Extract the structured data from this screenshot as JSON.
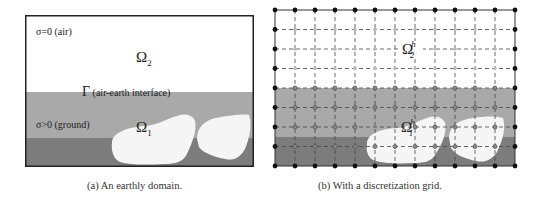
{
  "figure_a": {
    "caption": "(a) An earthly domain.",
    "labels": {
      "air": "σ=0  (air)",
      "omega2": "Ω",
      "omega2_sub": "2",
      "interface_symbol": "Γ",
      "interface": " (air-earth interface)",
      "ground": "σ>0  (ground)",
      "omega1": "Ω",
      "omega1_sub": "1"
    },
    "colors": {
      "air": "#ffffff",
      "ground_upper": "#a9a9a9",
      "ground_lower": "#7c7c7c",
      "inclusion": "#f5f5f5",
      "border": "#222222"
    }
  },
  "figure_b": {
    "caption": "(b) With a discretization grid.",
    "labels": {
      "omega2": "Ω",
      "omega2_sup": "h",
      "omega2_sub": "2",
      "omega1": "Ω",
      "omega1_sup": "h",
      "omega1_sub": "1"
    },
    "grid": {
      "columns": 12,
      "rows": 8,
      "boundary_node": "filled-black",
      "air_node": "light-gray",
      "ground_node": "gray-open-circle"
    }
  }
}
